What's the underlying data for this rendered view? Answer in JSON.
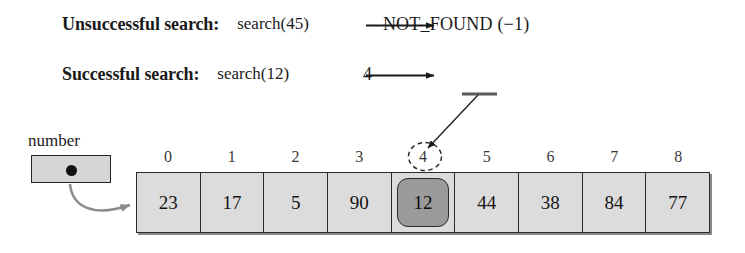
{
  "figure": {
    "colors": {
      "array_fill": "#dcdcdc",
      "highlight_fill": "#9a9a9a",
      "box_fill": "#d6d6d6",
      "stroke": "#2b2b2b",
      "pointer_arrow": "#8c8c8c",
      "index_text": "#3a3a3a"
    }
  },
  "examples": [
    {
      "label": "Unsuccessful search:",
      "call": "search(45)",
      "arrow": "right-arrow-icon",
      "result": "NOT_FOUND (−1)"
    },
    {
      "label": "Successful search:",
      "call": "search(12)",
      "arrow": "right-arrow-icon",
      "result": "4"
    }
  ],
  "pointer": {
    "name": "number",
    "dot": "pointer-dot-icon",
    "arrow": "curved-pointer-arrow-icon"
  },
  "array": {
    "indices": [
      "0",
      "1",
      "2",
      "3",
      "4",
      "5",
      "6",
      "7",
      "8"
    ],
    "values": [
      "23",
      "17",
      "5",
      "90",
      "12",
      "44",
      "38",
      "84",
      "77"
    ],
    "highlighted_index": 4,
    "highlighted_value": "12",
    "circled_index": "4"
  }
}
